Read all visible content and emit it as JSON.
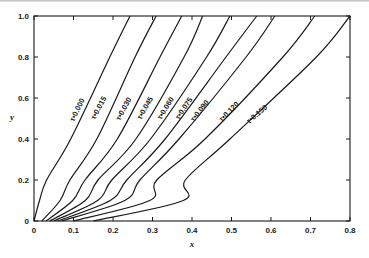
{
  "chart_data": {
    "type": "line",
    "title": "",
    "xlabel": "x",
    "ylabel": "y",
    "xlim": [
      0,
      0.8
    ],
    "ylim": [
      0,
      1.0
    ],
    "grid": false,
    "legend": "inline curve labels",
    "x_ticks": [
      "0",
      "0.1",
      "0.2",
      "0.3",
      "0.4",
      "0.5",
      "0.6",
      "0.7",
      "0.8"
    ],
    "y_ticks": [
      "0",
      "0.2",
      "0.4",
      "0.6",
      "0.8",
      "1.0"
    ],
    "y_levels": [
      0,
      0.1,
      0.2,
      0.4,
      0.8,
      1.0
    ],
    "series": [
      {
        "name": "τ = 0.000",
        "label": "τ•0.000",
        "x_at_y": [
          0.0,
          0.014,
          0.032,
          0.093,
          0.192,
          0.243
        ]
      },
      {
        "name": "τ = 0.015",
        "label": "τ•0.015",
        "x_at_y": [
          0.02,
          0.066,
          0.091,
          0.159,
          0.256,
          0.309
        ]
      },
      {
        "name": "τ = 0.030",
        "label": "τ•0.030",
        "x_at_y": [
          0.03,
          0.098,
          0.129,
          0.211,
          0.319,
          0.374
        ]
      },
      {
        "name": "τ = 0.045",
        "label": "τ•0.045",
        "x_at_y": [
          0.04,
          0.13,
          0.162,
          0.258,
          0.38,
          0.427
        ]
      },
      {
        "name": "τ = 0.060",
        "label": "τ•0.060",
        "x_at_y": [
          0.05,
          0.161,
          0.197,
          0.295,
          0.437,
          0.496
        ]
      },
      {
        "name": "τ = 0.075",
        "label": "τ•0.075",
        "x_at_y": [
          0.06,
          0.193,
          0.235,
          0.332,
          0.486,
          0.564
        ]
      },
      {
        "name": "τ = 0.090",
        "label": "τ•0.090",
        "x_at_y": [
          0.07,
          0.23,
          0.268,
          0.367,
          0.537,
          0.61
        ]
      },
      {
        "name": "τ = 0.120",
        "label": "τ•0.120",
        "x_at_y": [
          0.1,
          0.293,
          0.311,
          0.433,
          0.63,
          0.711
        ]
      },
      {
        "name": "τ = 0.150",
        "label": "τ•0.150",
        "x_at_y": [
          0.15,
          0.378,
          0.352,
          0.496,
          0.715,
          0.8
        ]
      }
    ]
  },
  "labels": {
    "xlabel": "x",
    "ylabel": "y",
    "x_ticks": [
      "0",
      "0.1",
      "0.2",
      "0.3",
      "0.4",
      "0.5",
      "0.6",
      "0.7",
      "0.8"
    ],
    "y_ticks": [
      "0",
      "0.2",
      "0.4",
      "0.6",
      "0.8",
      "1.0"
    ],
    "curves": [
      "τ•0.000",
      "τ•0.015",
      "τ•0.030",
      "τ•0.045",
      "τ•0.060",
      "τ•0.075",
      "τ•0.090",
      "τ•0.120",
      "τ•0.150"
    ]
  }
}
